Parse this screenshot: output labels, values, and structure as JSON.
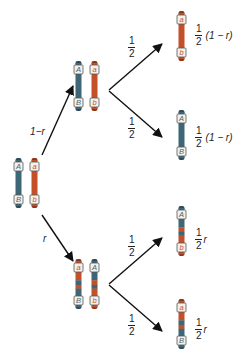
{
  "colors": {
    "blue": "#3f6677",
    "blue_dark": "#2c4a57",
    "orange": "#c4502a",
    "orange_dark": "#8f3419",
    "box_fill": "#f4f0ea",
    "box_stroke": "#555555",
    "arrow": "#111111",
    "text": "#222222"
  },
  "parent": {
    "chromosomes": [
      {
        "segments": [
          "blue"
        ],
        "top_allele": "A",
        "bottom_allele": "B"
      },
      {
        "segments": [
          "orange"
        ],
        "top_allele": "a",
        "bottom_allele": "b"
      }
    ]
  },
  "branches": [
    {
      "label": "1−r",
      "product_chromosomes": [
        {
          "segments": [
            "blue"
          ],
          "top_allele": "A",
          "bottom_allele": "B"
        },
        {
          "segments": [
            "orange"
          ],
          "top_allele": "a",
          "bottom_allele": "b"
        }
      ],
      "gametes": [
        {
          "edge_num": "1",
          "edge_den": "2",
          "segments": [
            "orange"
          ],
          "top_allele": "a",
          "bottom_allele": "b",
          "prob_num": "1",
          "prob_den": "2",
          "prob_tail": "(1 − r)"
        },
        {
          "edge_num": "1",
          "edge_den": "2",
          "segments": [
            "blue"
          ],
          "top_allele": "A",
          "bottom_allele": "B",
          "prob_num": "1",
          "prob_den": "2",
          "prob_tail": "(1 − r)"
        }
      ]
    },
    {
      "label": "r",
      "product_chromosomes": [
        {
          "segments": [
            "orange",
            "blue"
          ],
          "top_allele": "a",
          "bottom_allele": "B"
        },
        {
          "segments": [
            "blue",
            "orange"
          ],
          "top_allele": "A",
          "bottom_allele": "b"
        }
      ],
      "gametes": [
        {
          "edge_num": "1",
          "edge_den": "2",
          "segments": [
            "blue",
            "orange"
          ],
          "top_allele": "A",
          "bottom_allele": "b",
          "prob_num": "1",
          "prob_den": "2",
          "prob_tail": "r"
        },
        {
          "edge_num": "1",
          "edge_den": "2",
          "segments": [
            "orange",
            "blue"
          ],
          "top_allele": "a",
          "bottom_allele": "B",
          "prob_num": "1",
          "prob_den": "2",
          "prob_tail": "r"
        }
      ]
    }
  ]
}
